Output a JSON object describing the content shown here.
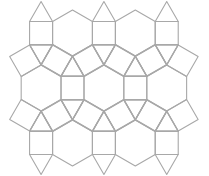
{
  "diagram": {
    "type": "rhombitrihexagonal-tiling-patch",
    "stroke_color": "#a8a8a8",
    "background": "#ffffff",
    "edge_length": 23,
    "hexagon_centers": [
      [
        72.5,
        33
      ],
      [
        135.3,
        33
      ],
      [
        41.1,
        88
      ],
      [
        103.9,
        88
      ],
      [
        166.7,
        88
      ],
      [
        72.5,
        143
      ],
      [
        135.3,
        143
      ]
    ]
  }
}
